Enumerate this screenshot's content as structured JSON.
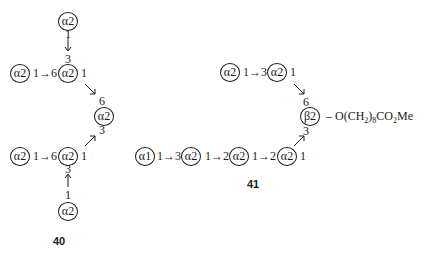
{
  "structures": [
    {
      "label": "40",
      "top_node": "α2",
      "top_link_from": "1",
      "top_link_to": "3",
      "row_upper": {
        "left_node": "α2",
        "link": "1→6",
        "mid_node": "α2",
        "out_pos": "1"
      },
      "core": {
        "pos_upper": "6",
        "node": "α2",
        "pos_lower": "3"
      },
      "row_lower": {
        "left_node": "α2",
        "link": "1→6",
        "mid_node": "α2",
        "out_pos": "1"
      },
      "bottom_link_to": "3",
      "bottom_link_from": "1",
      "bottom_node": "α2"
    },
    {
      "label": "41",
      "branch_upper": {
        "node1": "α2",
        "link": "1→3",
        "node2": "α2",
        "out_pos": "1"
      },
      "core": {
        "pos_upper": "6",
        "node": "β2",
        "pos_lower": "3",
        "aglycone_prefix": "– O(CH",
        "aglycone_sub1": "2",
        "aglycone_mid": ")",
        "aglycone_sub2": "8",
        "aglycone_suffix1": "CO",
        "aglycone_sub3": "2",
        "aglycone_suffix2": "Me"
      },
      "branch_lower": {
        "node1": "α1",
        "link1": "1→3",
        "node2": "α2",
        "link2": "1→2",
        "node3": "α2",
        "link3": "1→2",
        "node4": "α2",
        "out_pos": "1"
      }
    }
  ]
}
